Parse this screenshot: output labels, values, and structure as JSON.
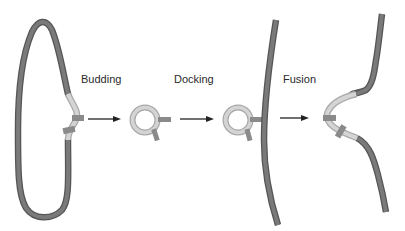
{
  "diagram": {
    "type": "vesicle-trafficking-process",
    "stages": [
      {
        "id": "budding",
        "label": "Budding"
      },
      {
        "id": "docking",
        "label": "Docking"
      },
      {
        "id": "fusion",
        "label": "Fusion"
      }
    ],
    "colors": {
      "membrane_dark": "#7a7a7a",
      "membrane_outline": "#555555",
      "membrane_light": "#cfcfcf",
      "protein_tag": "#8a8a8a",
      "arrow": "#222222",
      "background": "#ffffff"
    }
  }
}
